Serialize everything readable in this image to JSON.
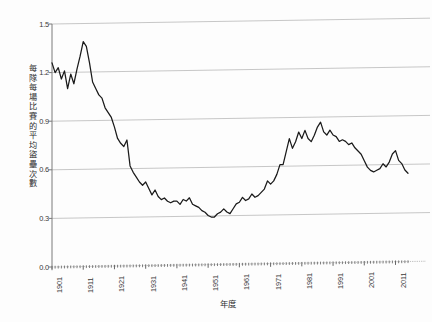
{
  "chart_data": {
    "type": "line",
    "title": "",
    "xlabel": "年度",
    "ylabel": "每隊每場比賽的平均盜壘次數",
    "xlim": [
      1901,
      2015
    ],
    "ylim": [
      0.0,
      1.5
    ],
    "grid": true,
    "legend": null,
    "line_color": "#1a1a1a",
    "grid_color": "#b9b9b9",
    "axis_color": "#7a7a7a",
    "y_ticks": [
      "0.0",
      "0.3",
      "0.6",
      "0.9",
      "1.2",
      "1.5"
    ],
    "y_tick_values": [
      0.0,
      0.3,
      0.6,
      0.9,
      1.2,
      1.5
    ],
    "x_ticks": [
      "1901",
      "1911",
      "1921",
      "1931",
      "1941",
      "1951",
      "1961",
      "1971",
      "1981",
      "1991",
      "2001",
      "2011"
    ],
    "x_tick_values": [
      1901,
      1911,
      1921,
      1931,
      1941,
      1951,
      1961,
      1971,
      1981,
      1991,
      2001,
      2011
    ],
    "x": [
      1901,
      1902,
      1903,
      1904,
      1905,
      1906,
      1907,
      1908,
      1909,
      1910,
      1911,
      1912,
      1913,
      1914,
      1915,
      1916,
      1917,
      1918,
      1919,
      1920,
      1921,
      1922,
      1923,
      1924,
      1925,
      1926,
      1927,
      1928,
      1929,
      1930,
      1931,
      1932,
      1933,
      1934,
      1935,
      1936,
      1937,
      1938,
      1939,
      1940,
      1941,
      1942,
      1943,
      1944,
      1945,
      1946,
      1947,
      1948,
      1949,
      1950,
      1951,
      1952,
      1953,
      1954,
      1955,
      1956,
      1957,
      1958,
      1959,
      1960,
      1961,
      1962,
      1963,
      1964,
      1965,
      1966,
      1967,
      1968,
      1969,
      1970,
      1971,
      1972,
      1973,
      1974,
      1975,
      1976,
      1977,
      1978,
      1979,
      1980,
      1981,
      1982,
      1983,
      1984,
      1985,
      1986,
      1987,
      1988,
      1989,
      1990,
      1991,
      1992,
      1993,
      1994,
      1995,
      1996,
      1997,
      1998,
      1999,
      2000,
      2001,
      2002,
      2003,
      2004,
      2005,
      2006,
      2007,
      2008,
      2009,
      2010,
      2011,
      2012,
      2013,
      2014,
      2015
    ],
    "values": [
      1.26,
      1.2,
      1.23,
      1.16,
      1.21,
      1.1,
      1.19,
      1.13,
      1.22,
      1.3,
      1.39,
      1.36,
      1.26,
      1.14,
      1.1,
      1.06,
      1.04,
      0.98,
      0.95,
      0.92,
      0.86,
      0.79,
      0.76,
      0.74,
      0.78,
      0.62,
      0.58,
      0.55,
      0.52,
      0.5,
      0.52,
      0.48,
      0.44,
      0.47,
      0.43,
      0.41,
      0.42,
      0.4,
      0.39,
      0.4,
      0.4,
      0.38,
      0.41,
      0.4,
      0.42,
      0.38,
      0.37,
      0.36,
      0.34,
      0.33,
      0.31,
      0.3,
      0.3,
      0.32,
      0.33,
      0.35,
      0.33,
      0.32,
      0.35,
      0.38,
      0.39,
      0.42,
      0.4,
      0.41,
      0.44,
      0.42,
      0.43,
      0.45,
      0.47,
      0.52,
      0.5,
      0.52,
      0.56,
      0.62,
      0.62,
      0.7,
      0.78,
      0.72,
      0.76,
      0.82,
      0.78,
      0.83,
      0.78,
      0.76,
      0.8,
      0.85,
      0.88,
      0.82,
      0.8,
      0.83,
      0.8,
      0.79,
      0.76,
      0.77,
      0.76,
      0.74,
      0.75,
      0.72,
      0.7,
      0.68,
      0.64,
      0.6,
      0.58,
      0.57,
      0.58,
      0.59,
      0.62,
      0.6,
      0.63,
      0.68,
      0.7,
      0.64,
      0.62,
      0.58,
      0.56
    ]
  }
}
